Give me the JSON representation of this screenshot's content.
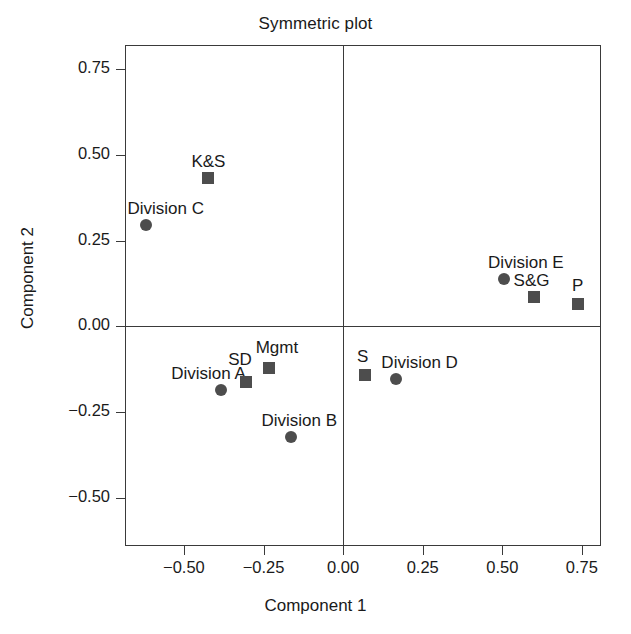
{
  "chart_data": {
    "type": "scatter",
    "title": "Symmetric plot",
    "xlabel": "Component 1",
    "ylabel": "Component 2",
    "xlim": [
      -0.685,
      0.81
    ],
    "ylim": [
      -0.64,
      0.82
    ],
    "xticks": [
      -0.5,
      -0.25,
      0.0,
      0.25,
      0.5,
      0.75
    ],
    "xticklabels": [
      "−0.50",
      "−0.25",
      "0.00",
      "0.25",
      "0.50",
      "0.75"
    ],
    "yticks": [
      0.75,
      0.5,
      0.25,
      0.0,
      -0.25,
      -0.5
    ],
    "yticklabels": [
      "0.75",
      "0.50",
      "0.25",
      "0.00",
      "−0.25",
      "−0.50"
    ],
    "grid": false,
    "legend": null,
    "zero_lines": {
      "x": 0.0,
      "y": 0.0
    },
    "marker_color": "#4d4d4d",
    "axis_color": "#3a3a3a",
    "series": [
      {
        "name": "Rows",
        "marker": "circle",
        "points": [
          {
            "label": "Division C",
            "x": -0.62,
            "y": 0.295,
            "label_dx": 20,
            "label_dy": -26
          },
          {
            "label": "Division A",
            "x": -0.385,
            "y": -0.185,
            "label_dx": -12,
            "label_dy": -26
          },
          {
            "label": "Division B",
            "x": -0.163,
            "y": -0.323,
            "label_dx": 8,
            "label_dy": -26
          },
          {
            "label": "Division D",
            "x": 0.165,
            "y": -0.153,
            "label_dx": 24,
            "label_dy": -26
          },
          {
            "label": "Division E",
            "x": 0.505,
            "y": 0.137,
            "label_dx": 22,
            "label_dy": -26
          }
        ]
      },
      {
        "name": "Columns",
        "marker": "square",
        "points": [
          {
            "label": "K&S",
            "x": -0.423,
            "y": 0.432,
            "label_dx": 0,
            "label_dy": -26
          },
          {
            "label": "SD",
            "x": -0.305,
            "y": -0.163,
            "label_dx": -6,
            "label_dy": -32
          },
          {
            "label": "Mgmt",
            "x": -0.233,
            "y": -0.122,
            "label_dx": 8,
            "label_dy": -30
          },
          {
            "label": "S",
            "x": 0.068,
            "y": -0.143,
            "label_dx": -2,
            "label_dy": -28
          },
          {
            "label": "S&G",
            "x": 0.598,
            "y": 0.086,
            "label_dx": -2,
            "label_dy": -26
          },
          {
            "label": "P",
            "x": 0.737,
            "y": 0.066,
            "label_dx": 0,
            "label_dy": -28
          }
        ]
      }
    ]
  }
}
